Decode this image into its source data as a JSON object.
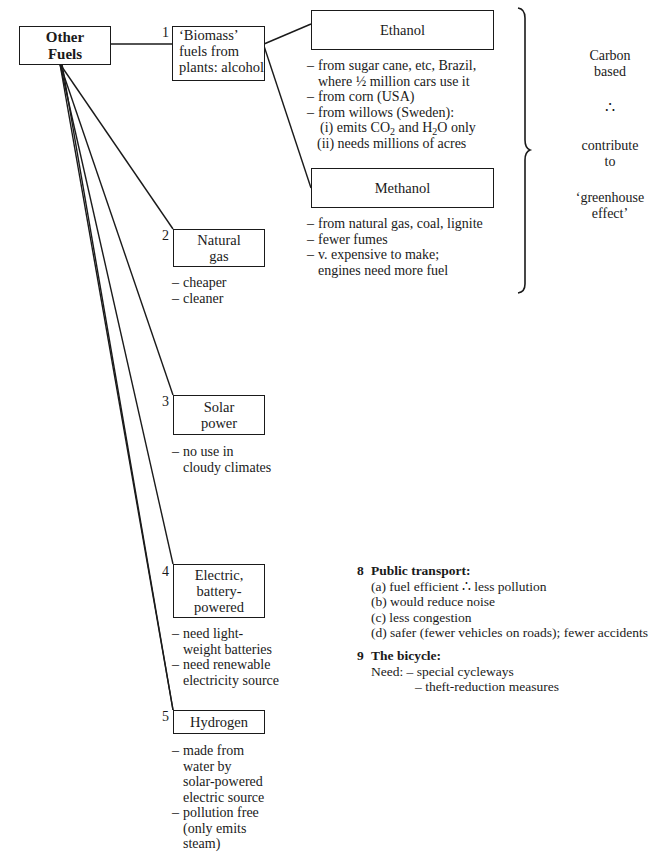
{
  "root": {
    "label_line1": "Other",
    "label_line2": "Fuels"
  },
  "branches": [
    {
      "number": "1",
      "label_lines": [
        "‘Biomass’",
        "fuels from",
        "plants: alcohol"
      ],
      "children": [
        {
          "label": "Ethanol",
          "notes": [
            {
              "text": "from sugar cane, etc, Brazil,",
              "cont": "where ½ million cars use it"
            },
            {
              "text": "from corn (USA)"
            },
            {
              "text": "from willows (Sweden):"
            }
          ],
          "subnotes": [
            {
              "prefix": "(i) emits CO",
              "sub1": "2",
              "mid": " and H",
              "sub2": "2",
              "suffix": "O only"
            },
            {
              "text": "(ii) needs millions of acres"
            }
          ]
        },
        {
          "label": "Methanol",
          "notes": [
            {
              "text": "from natural gas, coal, lignite"
            },
            {
              "text": "fewer fumes"
            },
            {
              "text": "v. expensive to make;",
              "cont": "engines need more fuel"
            }
          ]
        }
      ]
    },
    {
      "number": "2",
      "label_lines": [
        "Natural",
        "gas"
      ],
      "notes": [
        {
          "text": "cheaper"
        },
        {
          "text": "cleaner"
        }
      ]
    },
    {
      "number": "3",
      "label_lines": [
        "Solar",
        "power"
      ],
      "notes": [
        {
          "text": "no use in",
          "cont": "cloudy climates"
        }
      ]
    },
    {
      "number": "4",
      "label_lines": [
        "Electric,",
        "battery-",
        "powered"
      ],
      "notes": [
        {
          "text": "need light-",
          "cont": "weight batteries"
        },
        {
          "text": "need renewable",
          "cont": "electricity source"
        }
      ]
    },
    {
      "number": "5",
      "label_lines": [
        "Hydrogen"
      ],
      "notes": [
        {
          "text": "made from",
          "cont": "water by",
          "cont2": "solar-powered",
          "cont3": "electric source"
        },
        {
          "text": "pollution free",
          "cont": "(only emits",
          "cont2": "steam)"
        }
      ]
    }
  ],
  "brace_annotation": {
    "line1": "Carbon",
    "line2": "based",
    "therefore": "∴",
    "line3": "contribute",
    "line4": "to",
    "line5": "‘greenhouse",
    "line6": "effect’"
  },
  "sections": [
    {
      "number": "8",
      "title": "Public transport:",
      "items": [
        "(a) fuel efficient ∴ less pollution",
        "(b) would reduce noise",
        "(c) less congestion",
        "(d) safer (fewer vehicles on roads); fewer accidents"
      ]
    },
    {
      "number": "9",
      "title": "The bicycle:",
      "need_label": "Need:",
      "items": [
        "– special cycleways",
        "– theft-reduction measures"
      ]
    }
  ],
  "dash": "–",
  "colors": {
    "ink": "#1a1a1a",
    "paper": "#ffffff"
  }
}
